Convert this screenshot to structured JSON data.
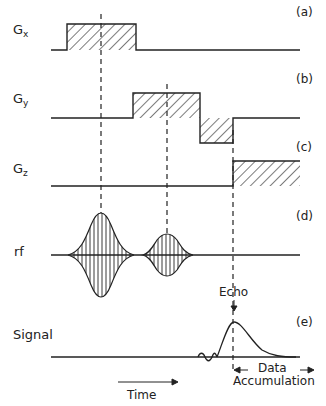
{
  "diagram": {
    "rows": [
      {
        "id": "gx",
        "label": "G",
        "subscript": "x",
        "tag": "(a)"
      },
      {
        "id": "gy",
        "label": "G",
        "subscript": "y",
        "tag": "(b)"
      },
      {
        "id": "gz",
        "label": "G",
        "subscript": "z",
        "tag": "(c)"
      },
      {
        "id": "rf",
        "label": "rf",
        "tag": "(d)"
      },
      {
        "id": "signal",
        "label": "Signal",
        "tag": "(e)"
      }
    ],
    "annotations": {
      "echo": "Echo",
      "time": "Time",
      "data_line1": "Data",
      "data_line2": "Accumulation"
    },
    "colors": {
      "line": "#222222",
      "background": "#ffffff"
    }
  }
}
